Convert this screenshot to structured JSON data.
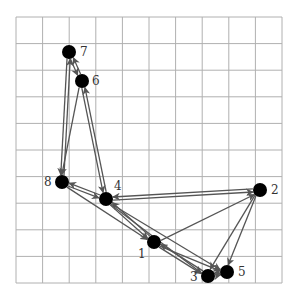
{
  "diagram": {
    "type": "directed-graph-on-grid",
    "grid": {
      "x0": 16,
      "y0": 17,
      "x1": 282,
      "y1": 283,
      "cols": 10,
      "rows": 10,
      "color": "#b0b0b0"
    },
    "edge_color": "#555555",
    "node_color": "#000000",
    "nodes": [
      {
        "id": "1",
        "label": "1",
        "x": 154,
        "y": 242,
        "lx": 138,
        "ly": 258
      },
      {
        "id": "2",
        "label": "2",
        "x": 260,
        "y": 190,
        "lx": 271,
        "ly": 194
      },
      {
        "id": "3",
        "label": "3",
        "x": 208,
        "y": 276,
        "lx": 190,
        "ly": 281
      },
      {
        "id": "4",
        "label": "4",
        "x": 106,
        "y": 199,
        "lx": 114,
        "ly": 190
      },
      {
        "id": "5",
        "label": "5",
        "x": 227,
        "y": 272,
        "lx": 238,
        "ly": 276
      },
      {
        "id": "6",
        "label": "6",
        "x": 82,
        "y": 81,
        "lx": 92,
        "ly": 85
      },
      {
        "id": "7",
        "label": "7",
        "x": 69,
        "y": 52,
        "lx": 80,
        "ly": 56
      },
      {
        "id": "8",
        "label": "8",
        "x": 62,
        "y": 182,
        "lx": 44,
        "ly": 186
      }
    ],
    "edges": [
      [
        "7",
        "8"
      ],
      [
        "8",
        "7"
      ],
      [
        "7",
        "6"
      ],
      [
        "6",
        "7"
      ],
      [
        "6",
        "8"
      ],
      [
        "6",
        "4"
      ],
      [
        "4",
        "6"
      ],
      [
        "8",
        "4"
      ],
      [
        "4",
        "8"
      ],
      [
        "8",
        "1"
      ],
      [
        "4",
        "1"
      ],
      [
        "1",
        "4"
      ],
      [
        "4",
        "2"
      ],
      [
        "2",
        "4"
      ],
      [
        "4",
        "3"
      ],
      [
        "4",
        "5"
      ],
      [
        "1",
        "2"
      ],
      [
        "1",
        "3"
      ],
      [
        "3",
        "1"
      ],
      [
        "1",
        "5"
      ],
      [
        "2",
        "3"
      ],
      [
        "2",
        "5"
      ],
      [
        "3",
        "5"
      ],
      [
        "5",
        "3"
      ]
    ]
  }
}
